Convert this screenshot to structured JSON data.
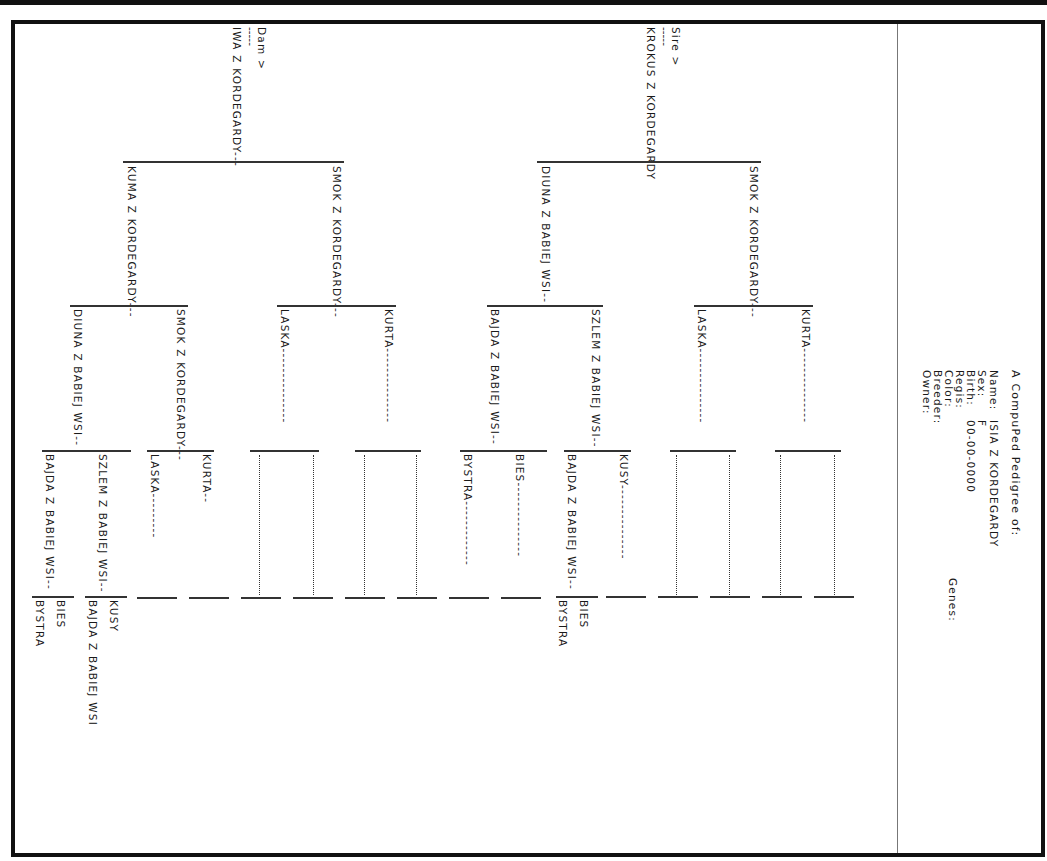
{
  "document": {
    "title": "A CompuPed Pedigree of:",
    "subject": {
      "name_label": "Name:",
      "name": "ISIA Z KORDEGARDY",
      "sex_label": "Sex:",
      "sex": "F",
      "birth_label": "Birth:",
      "birth": "00-00-0000",
      "regis_label": "Regis:",
      "regis": "",
      "color_label": "Color:",
      "color": "",
      "breeder_label": "Breeder:",
      "breeder": "",
      "owner_label": "Owner:",
      "owner": "",
      "genes_label": "Genes:"
    },
    "sire": {
      "heading": "Sire >",
      "dashes": "-----",
      "name": "KROKUS Z KORDEGARDY",
      "sire": {
        "name": "SMOK Z KORDEGARDY---",
        "sire": {
          "name": "KURTA---------------"
        },
        "dam": {
          "name": "LASKA---------------"
        }
      },
      "dam": {
        "name": "DIUNA Z BABIEJ WSI--",
        "sire": {
          "name": "SZLEM Z BABIEJ WSI--",
          "sire": {
            "name": "KUSY---------------"
          },
          "dam": {
            "name": "BAJDA Z BABIEJ WSI--",
            "sire": "BIES",
            "dam": "BYSTRA"
          }
        },
        "dam": {
          "name": "BAJDA Z BABIEJ WSI--",
          "sire": {
            "name": "BIES---------------"
          },
          "dam": {
            "name": "BYSTRA-------------"
          }
        }
      }
    },
    "dam": {
      "heading": "Dam >",
      "dashes": "-----",
      "name": "IWA Z KORDEGARDY---",
      "sire": {
        "name": "SMOK Z KORDEGARDY---",
        "sire": {
          "name": "KURTA---------------"
        },
        "dam": {
          "name": "LASKA---------------"
        }
      },
      "dam": {
        "name": "KUMA Z KORDEGARDY---",
        "sire": {
          "name": "SMOK Z KORDEGARDY---",
          "sire": {
            "name": "KURTA--"
          },
          "dam": {
            "name": "LASKA---------"
          }
        },
        "dam": {
          "name": "DIUNA Z BABIEJ WSI--",
          "sire": {
            "name": "SZLEM Z BABIEJ WSI--",
            "sire": "KUSY",
            "dam": "BAJDA Z BABIEJ WSI"
          },
          "dam": {
            "name": "BAJDA Z BABIEJ WSI--",
            "sire": "BIES",
            "dam": "BYSTRA"
          }
        }
      }
    }
  }
}
